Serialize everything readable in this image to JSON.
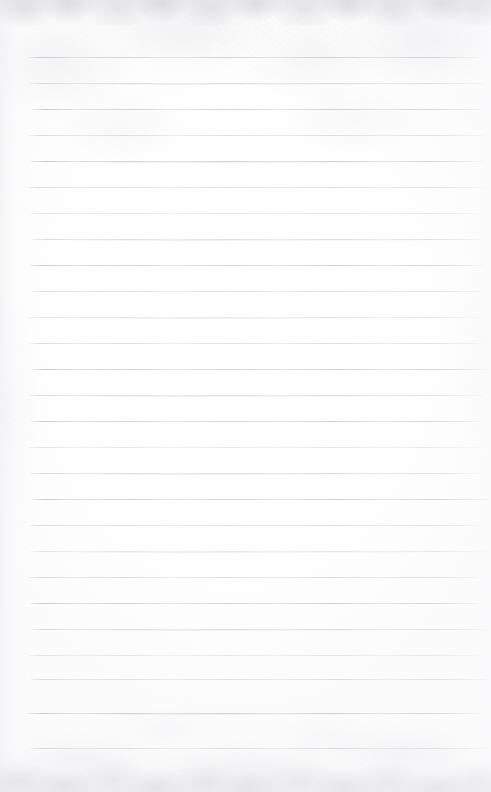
{
  "document": {
    "kind": "scanned-blank-lined-paper",
    "page_width": 491,
    "page_height": 792,
    "text_content": "",
    "written_text": "",
    "annotations": [],
    "colors": {
      "paper": "#fdfdfd",
      "paper_shade": "#fbfbfc",
      "rule_line": "#c8c8d0",
      "rule_line_light": "#e4e4e9",
      "edge_texture": "#d8d8de"
    }
  },
  "ruling": {
    "line_count": 27,
    "first_line_y": 57,
    "line_spacing": 26,
    "line_left_x": 30,
    "line_right_x": 484,
    "line_thickness": 1,
    "lines": [
      {
        "index": 1,
        "y": 57,
        "weight": "strong"
      },
      {
        "index": 2,
        "y": 83,
        "weight": "soft"
      },
      {
        "index": 3,
        "y": 109,
        "weight": "strong"
      },
      {
        "index": 4,
        "y": 135,
        "weight": "soft"
      },
      {
        "index": 5,
        "y": 161,
        "weight": "strong"
      },
      {
        "index": 6,
        "y": 187,
        "weight": "soft"
      },
      {
        "index": 7,
        "y": 213,
        "weight": "faint"
      },
      {
        "index": 8,
        "y": 239,
        "weight": "soft"
      },
      {
        "index": 9,
        "y": 265,
        "weight": "strong"
      },
      {
        "index": 10,
        "y": 291,
        "weight": "soft"
      },
      {
        "index": 11,
        "y": 317,
        "weight": "faint"
      },
      {
        "index": 12,
        "y": 343,
        "weight": "soft"
      },
      {
        "index": 13,
        "y": 369,
        "weight": "strong"
      },
      {
        "index": 14,
        "y": 395,
        "weight": "soft"
      },
      {
        "index": 15,
        "y": 421,
        "weight": "strong"
      },
      {
        "index": 16,
        "y": 447,
        "weight": "faint"
      },
      {
        "index": 17,
        "y": 473,
        "weight": "soft"
      },
      {
        "index": 18,
        "y": 499,
        "weight": "strong"
      },
      {
        "index": 19,
        "y": 525,
        "weight": "soft"
      },
      {
        "index": 20,
        "y": 551,
        "weight": "faint"
      },
      {
        "index": 21,
        "y": 577,
        "weight": "soft"
      },
      {
        "index": 22,
        "y": 603,
        "weight": "strong"
      },
      {
        "index": 23,
        "y": 629,
        "weight": "soft"
      },
      {
        "index": 24,
        "y": 655,
        "weight": "faint"
      },
      {
        "index": 25,
        "y": 679,
        "weight": "soft"
      },
      {
        "index": 26,
        "y": 713,
        "weight": "strong"
      },
      {
        "index": 27,
        "y": 748,
        "weight": "soft"
      }
    ]
  },
  "margins": {
    "top_blank_height": 57,
    "bottom_blank_height": 44,
    "left_blank_width": 30,
    "right_blank_width": 7
  }
}
